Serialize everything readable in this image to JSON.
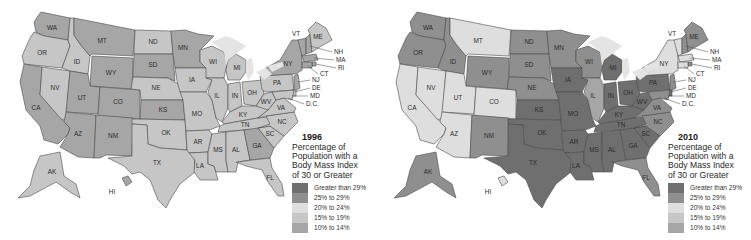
{
  "palette": {
    "gt29": "#6f6f6f",
    "25to29": "#8f8f8f",
    "20to24": "#dedede",
    "15to19": "#c6c6c6",
    "10to14": "#a6a6a6"
  },
  "legend": {
    "title": "Percentage of Population with a Body Mass Index of 30 or Greater",
    "title_lines": [
      "Percentage of",
      "Population with a",
      "Body Mass Index",
      "of 30 or Greater"
    ],
    "items": [
      {
        "key": "gt29",
        "label": "Greater than 29%"
      },
      {
        "key": "25to29",
        "label": "25% to 29%"
      },
      {
        "key": "20to24",
        "label": "20% to 24%"
      },
      {
        "key": "15to19",
        "label": "15% to 19%"
      },
      {
        "key": "10to14",
        "label": "10% to 14%"
      }
    ]
  },
  "maps": [
    {
      "year": "1996",
      "states": {
        "WA": "10to14",
        "OR": "15to19",
        "CA": "10to14",
        "NV": "15to19",
        "ID": "15to19",
        "MT": "10to14",
        "WY": "10to14",
        "UT": "10to14",
        "AZ": "10to14",
        "CO": "10to14",
        "NM": "10to14",
        "ND": "15to19",
        "SD": "10to14",
        "NE": "15to19",
        "KS": "10to14",
        "OK": "15to19",
        "TX": "15to19",
        "MN": "10to14",
        "IA": "15to19",
        "MO": "15to19",
        "AR": "15to19",
        "LA": "15to19",
        "WI": "15to19",
        "IL": "15to19",
        "MI": "15to19",
        "IN": "15to19",
        "OH": "15to19",
        "KY": "15to19",
        "TN": "15to19",
        "MS": "15to19",
        "AL": "15to19",
        "GA": "10to14",
        "FL": "15to19",
        "SC": "15to19",
        "NC": "15to19",
        "VA": "15to19",
        "WV": "15to19",
        "PA": "15to19",
        "NY": "10to14",
        "VT": "10to14",
        "NH": "10to14",
        "ME": "15to19",
        "MA": "10to14",
        "RI": "10to14",
        "CT": "10to14",
        "NJ": "10to14",
        "DE": "15to19",
        "MD": "15to19",
        "AK": "15to19",
        "HI": "10to14"
      }
    },
    {
      "year": "2010",
      "states": {
        "WA": "25to29",
        "OR": "25to29",
        "CA": "20to24",
        "NV": "20to24",
        "ID": "25to29",
        "MT": "20to24",
        "WY": "25to29",
        "UT": "20to24",
        "AZ": "20to24",
        "CO": "20to24",
        "NM": "25to29",
        "ND": "25to29",
        "SD": "25to29",
        "NE": "25to29",
        "KS": "gt29",
        "OK": "gt29",
        "TX": "gt29",
        "MN": "25to29",
        "IA": "gt29",
        "MO": "gt29",
        "AR": "gt29",
        "LA": "gt29",
        "WI": "25to29",
        "IL": "10to14",
        "MI": "gt29",
        "IN": "gt29",
        "OH": "gt29",
        "KY": "gt29",
        "TN": "gt29",
        "MS": "gt29",
        "AL": "gt29",
        "GA": "gt29",
        "FL": "25to29",
        "SC": "gt29",
        "NC": "25to29",
        "VA": "25to29",
        "WV": "gt29",
        "PA": "gt29",
        "NY": "20to24",
        "VT": "20to24",
        "NH": "25to29",
        "ME": "25to29",
        "MA": "20to24",
        "RI": "25to29",
        "CT": "20to24",
        "NJ": "25to29",
        "DE": "gt29",
        "MD": "25to29",
        "AK": "25to29",
        "HI": "20to24"
      }
    }
  ],
  "labels": {
    "WA": "WA",
    "OR": "OR",
    "CA": "CA",
    "NV": "NV",
    "ID": "ID",
    "MT": "MT",
    "WY": "WY",
    "UT": "UT",
    "AZ": "AZ",
    "CO": "CO",
    "NM": "NM",
    "ND": "ND",
    "SD": "SD",
    "NE": "NE",
    "KS": "KS",
    "OK": "OK",
    "TX": "TX",
    "MN": "MN",
    "IA": "IA",
    "MO": "MO",
    "AR": "AR",
    "LA": "LA",
    "WI": "WI",
    "IL": "IL",
    "MI": "MI",
    "IN": "IN",
    "OH": "OH",
    "KY": "KY",
    "TN": "TN",
    "MS": "MS",
    "AL": "AL",
    "GA": "GA",
    "FL": "FL",
    "SC": "SC",
    "NC": "NC",
    "VA": "VA",
    "WV": "WV",
    "PA": "PA",
    "NY": "NY",
    "VT": "VT",
    "NH": "NH",
    "ME": "ME",
    "MA": "MA",
    "RI": "RI",
    "CT": "CT",
    "NJ": "NJ",
    "DE": "DE",
    "MD": "MD",
    "DC": "D.C.",
    "AK": "AK",
    "HI": "HI"
  }
}
